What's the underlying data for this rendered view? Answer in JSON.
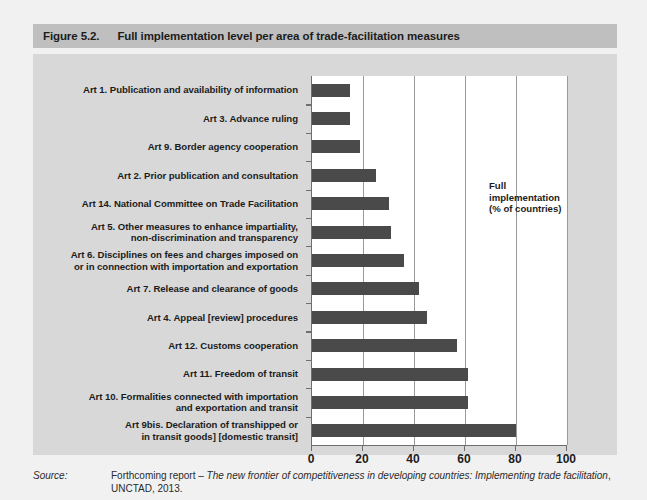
{
  "figure": {
    "number": "Figure 5.2.",
    "title": "Full implementation level per area of trade-facilitation measures"
  },
  "legend": {
    "text": "Full\nimplementation\n(% of countries)"
  },
  "source": {
    "label": "Source:",
    "prefix": "Forthcoming report – ",
    "italic": "The new frontier of competitiveness in developing countries: Implementing trade facilitation",
    "suffix": ", UNCTAD, 2013."
  },
  "colors": {
    "bar": "#4a4a4a",
    "panel_background": "#d8d8d8",
    "plot_background": "#ffffff",
    "title_bar": "#bfbfbf",
    "page_background": "#f1f1f1",
    "axis": "#6e6e6e",
    "gridline": "#9a9a9a"
  },
  "chart_data": {
    "type": "bar",
    "orientation": "horizontal",
    "title": "Full implementation level per area of trade-facilitation measures",
    "xlabel": "",
    "ylabel": "",
    "xlim": [
      0,
      100
    ],
    "xticks": [
      "0",
      "20",
      "40",
      "60",
      "80",
      "100"
    ],
    "xtick_values": [
      0,
      20,
      40,
      60,
      80,
      100
    ],
    "grid": true,
    "legend_position": "inside-right",
    "legend_entries": [
      "Full implementation (% of countries)"
    ],
    "categories": [
      "Art 1. Publication and availability of information",
      "Art 3. Advance ruling",
      "Art 9. Border agency cooperation",
      "Art 2. Prior publication and consultation",
      "Art 14. National Committee on Trade Facilitation",
      "Art 5. Other measures to enhance impartiality,\nnon-discrimination and transparency",
      "Art 6. Disciplines on fees and charges imposed on\nor in connection with importation and exportation",
      "Art 7. Release and clearance of goods",
      "Art 4. Appeal [review] procedures",
      "Art 12. Customs cooperation",
      "Art 11. Freedom of transit",
      "Art 10. Formalities connected with importation\nand exportation and transit",
      "Art 9bis. Declaration of transhipped or\nin transit goods] [domestic transit]"
    ],
    "values": [
      15,
      15,
      19,
      25,
      30,
      31,
      36,
      42,
      45,
      57,
      61,
      61,
      80
    ]
  }
}
